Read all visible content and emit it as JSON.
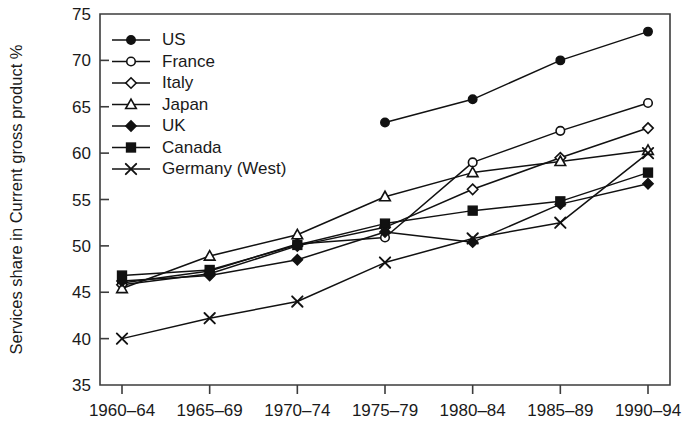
{
  "chart_data": {
    "type": "line",
    "title": "",
    "xlabel": "",
    "ylabel": "Services share in Current gross product %",
    "categories": [
      "1960–64",
      "1965–69",
      "1970–74",
      "1975–79",
      "1980–84",
      "1985–89",
      "1990–94"
    ],
    "ylim": [
      35,
      75
    ],
    "yticks": [
      35,
      40,
      45,
      50,
      55,
      60,
      65,
      70,
      75
    ],
    "grid": false,
    "legend_position": "top-left-inside",
    "series": [
      {
        "name": "US",
        "marker": "filled-circle",
        "values": [
          null,
          null,
          null,
          63.3,
          65.8,
          70.0,
          73.1
        ]
      },
      {
        "name": "France",
        "marker": "open-circle",
        "values": [
          46.0,
          47.3,
          50.2,
          50.9,
          59.0,
          62.4,
          65.4
        ]
      },
      {
        "name": "Italy",
        "marker": "open-diamond",
        "values": [
          45.8,
          47.0,
          50.0,
          52.0,
          56.1,
          59.5,
          62.7
        ]
      },
      {
        "name": "Japan",
        "marker": "open-triangle",
        "values": [
          45.4,
          48.9,
          51.2,
          55.3,
          57.9,
          59.1,
          60.3
        ]
      },
      {
        "name": "UK",
        "marker": "filled-diamond",
        "values": [
          46.2,
          46.8,
          48.5,
          51.5,
          50.4,
          54.5,
          56.7
        ]
      },
      {
        "name": "Canada",
        "marker": "filled-square",
        "values": [
          46.8,
          47.4,
          50.1,
          52.4,
          53.8,
          54.8,
          57.9
        ]
      },
      {
        "name": "Germany (West)",
        "marker": "cross",
        "values": [
          40.0,
          42.2,
          44.0,
          48.2,
          50.8,
          52.5,
          60.0
        ]
      }
    ]
  },
  "colors": {
    "ink": "#111111",
    "axis": "#3c3c3c",
    "background": "#ffffff"
  }
}
